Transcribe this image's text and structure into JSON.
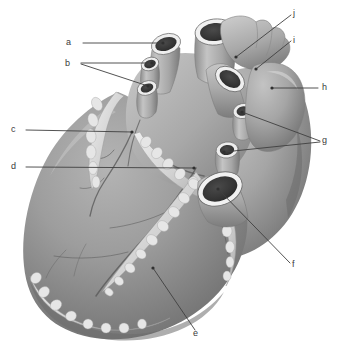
{
  "figure": {
    "type": "anatomical-illustration",
    "background_color": "#ffffff",
    "style": "grayscale medical illustration, stippled shading",
    "palette": {
      "paper": "#ffffff",
      "myocardium_light": "#b9b9b9",
      "myocardium_mid": "#9a9a9a",
      "myocardium_dark": "#7b7b7b",
      "myocardium_shadow": "#5e5e5e",
      "vessel_light": "#c9c9c9",
      "vessel_mid": "#a3a3a3",
      "lumen_dark": "#3c3c3c",
      "lumen_darkest": "#2a2a2a",
      "rim_highlight": "#f0f0f0",
      "fat_light": "#e3e3e3",
      "fat_mid": "#c6c6c6",
      "vein_line": "#555555",
      "leader_line": "#404040",
      "label_text": "#3a3a3a"
    }
  },
  "labels": [
    {
      "id": "a",
      "text": "a",
      "text_x": 66,
      "text_y": 38,
      "leaders": [
        {
          "points": "83,43 163,43",
          "dot": "163,43"
        }
      ]
    },
    {
      "id": "b",
      "text": "b",
      "text_x": 65,
      "text_y": 59,
      "leaders": [
        {
          "points": "81,63 152,63",
          "dot": "152,63"
        },
        {
          "points": "81,64 148,86",
          "dot": "148,86"
        }
      ]
    },
    {
      "id": "c",
      "text": "c",
      "text_x": 11,
      "text_y": 125,
      "leaders": [
        {
          "points": "26,130 132,132",
          "dot": "132,132"
        }
      ]
    },
    {
      "id": "d",
      "text": "d",
      "text_x": 11,
      "text_y": 162,
      "leaders": [
        {
          "points": "26,167 194,168",
          "dot": "194,168"
        }
      ]
    },
    {
      "id": "e",
      "text": "e",
      "text_x": 193,
      "text_y": 329,
      "leaders": [
        {
          "points": "195,330 153,268",
          "dot": "153,268"
        }
      ]
    },
    {
      "id": "f",
      "text": "f",
      "text_x": 292,
      "text_y": 260,
      "leaders": [
        {
          "points": "290,263 218,189",
          "dot": "218,189"
        }
      ]
    },
    {
      "id": "g",
      "text": "g",
      "text_x": 322,
      "text_y": 136,
      "leaders": [
        {
          "points": "320,141 242,112",
          "dot": "242,112"
        },
        {
          "points": "320,142 224,152",
          "dot": "224,152"
        }
      ]
    },
    {
      "id": "h",
      "text": "h",
      "text_x": 322,
      "text_y": 83,
      "leaders": [
        {
          "points": "318,88 272,88",
          "dot": "272,88"
        }
      ]
    },
    {
      "id": "i",
      "text": "i",
      "text_x": 293,
      "text_y": 36,
      "leaders": [
        {
          "points": "291,41 256,69",
          "dot": "256,69"
        }
      ]
    },
    {
      "id": "j",
      "text": "j",
      "text_x": 293,
      "text_y": 9,
      "leaders": [
        {
          "points": "291,15 236,57",
          "dot": "236,57"
        }
      ]
    }
  ],
  "structures": [
    {
      "name": "superior-vena-cava-stump",
      "label_ref": "a"
    },
    {
      "name": "right-pulmonary-vein-stumps",
      "label_ref": "b"
    },
    {
      "name": "coronary-sulcus-vessel",
      "label_ref": "c"
    },
    {
      "name": "posterior-interventricular-groove",
      "label_ref": "d"
    },
    {
      "name": "left-ventricle-apex-region",
      "label_ref": "e"
    },
    {
      "name": "inferior-vena-cava-stump",
      "label_ref": "f"
    },
    {
      "name": "left-pulmonary-vein-stumps",
      "label_ref": "g"
    },
    {
      "name": "left-ventricle-posterior-wall",
      "label_ref": "h"
    },
    {
      "name": "pulmonary-trunk-stump",
      "label_ref": "i"
    },
    {
      "name": "left-auricle",
      "label_ref": "j"
    }
  ]
}
